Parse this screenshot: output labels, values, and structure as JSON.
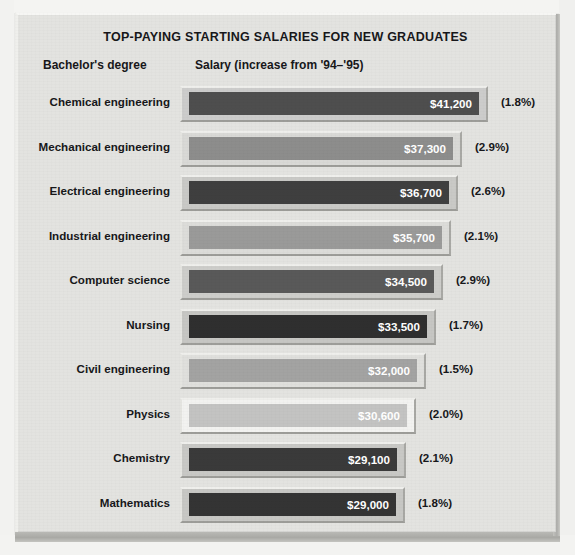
{
  "chart_data": {
    "type": "bar",
    "title": "TOP-PAYING STARTING SALARIES FOR NEW GRADUATES",
    "column_headers": {
      "category": "Bachelor's degree",
      "value": "Salary (increase from '94–'95)"
    },
    "orientation": "horizontal",
    "xlabel": "",
    "ylabel": "",
    "grid": false,
    "legend": "none",
    "xlim": [
      0,
      41200
    ],
    "categories": [
      "Chemical engineering",
      "Mechanical engineering",
      "Electrical engineering",
      "Industrial engineering",
      "Computer science",
      "Nursing",
      "Civil engineering",
      "Physics",
      "Chemistry",
      "Mathematics"
    ],
    "values": [
      41200,
      37300,
      36700,
      35700,
      34500,
      33500,
      32000,
      30600,
      29100,
      29000
    ],
    "value_labels": [
      "$41,200",
      "$37,300",
      "$36,700",
      "$35,700",
      "$34,500",
      "$33,500",
      "$32,000",
      "$30,600",
      "$29,100",
      "$29,000"
    ],
    "increase_labels": [
      "(1.8%)",
      "(2.9%)",
      "(2.6%)",
      "(2.1%)",
      "(2.9%)",
      "(1.7%)",
      "(1.5%)",
      "(2.0%)",
      "(2.1%)",
      "(1.8%)"
    ],
    "increase_values": [
      1.8,
      2.9,
      2.6,
      2.1,
      2.9,
      1.7,
      1.5,
      2.0,
      2.1,
      1.8
    ]
  },
  "rows": [
    {
      "label": "Chemical engineering",
      "value_label": "$41,200",
      "pct_label": "(1.8%)",
      "bar_px": 308,
      "face_color": "#4e4e4e",
      "shell_color": "#cccccb",
      "text_color": "#ffffff"
    },
    {
      "label": "Mechanical engineering",
      "value_label": "$37,300",
      "pct_label": "(2.9%)",
      "bar_px": 282,
      "face_color": "#8d8d8c",
      "shell_color": "#d9d9d6",
      "text_color": "#ffffff"
    },
    {
      "label": "Electrical engineering",
      "value_label": "$36,700",
      "pct_label": "(2.6%)",
      "bar_px": 278,
      "face_color": "#3f3f3f",
      "shell_color": "#c9c9c6",
      "text_color": "#ffffff"
    },
    {
      "label": "Industrial engineering",
      "value_label": "$35,700",
      "pct_label": "(2.1%)",
      "bar_px": 271,
      "face_color": "#9a9a99",
      "shell_color": "#dcdcd9",
      "text_color": "#ffffff"
    },
    {
      "label": "Computer science",
      "value_label": "$34,500",
      "pct_label": "(2.9%)",
      "bar_px": 263,
      "face_color": "#595959",
      "shell_color": "#cdcdca",
      "text_color": "#ffffff"
    },
    {
      "label": "Nursing",
      "value_label": "$33,500",
      "pct_label": "(1.7%)",
      "bar_px": 256,
      "face_color": "#2f2f2f",
      "shell_color": "#c6c6c3",
      "text_color": "#ffffff"
    },
    {
      "label": "Civil engineering",
      "value_label": "$32,000",
      "pct_label": "(1.5%)",
      "bar_px": 246,
      "face_color": "#a3a3a2",
      "shell_color": "#dfdfdc",
      "text_color": "#ffffff"
    },
    {
      "label": "Physics",
      "value_label": "$30,600",
      "pct_label": "(2.0%)",
      "bar_px": 236,
      "face_color": "#c3c3c2",
      "shell_color": "#f2f2f0",
      "text_color": "#ffffff"
    },
    {
      "label": "Chemistry",
      "value_label": "$29,100",
      "pct_label": "(2.1%)",
      "bar_px": 226,
      "face_color": "#3a3a3a",
      "shell_color": "#c8c8c5",
      "text_color": "#ffffff"
    },
    {
      "label": "Mathematics",
      "value_label": "$29,000",
      "pct_label": "(1.8%)",
      "bar_px": 225,
      "face_color": "#343434",
      "shell_color": "#c7c7c4",
      "text_color": "#ffffff"
    }
  ]
}
